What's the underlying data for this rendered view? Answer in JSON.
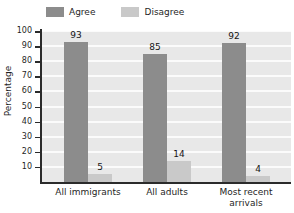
{
  "chart_data": {
    "type": "bar",
    "title": "",
    "xlabel": "",
    "ylabel": "Percentage",
    "ylim": [
      0,
      100
    ],
    "ytick_step": 10,
    "grid": true,
    "legend_position": "top",
    "categories": [
      "All immigrants",
      "All adults",
      "Most recent arrivals"
    ],
    "series": [
      {
        "name": "Agree",
        "color": "#8c8c8c",
        "values": [
          93,
          85,
          92
        ]
      },
      {
        "name": "Disagree",
        "color": "#c9c9c9",
        "values": [
          5,
          14,
          4
        ]
      }
    ],
    "y_ticks": [
      100,
      90,
      80,
      70,
      60,
      50,
      40,
      30,
      20,
      10
    ],
    "data_labels": [
      "93",
      "5",
      "85",
      "14",
      "92",
      "4"
    ],
    "category_lines": [
      [
        "All immigrants"
      ],
      [
        "All adults"
      ],
      [
        "Most recent",
        "arrivals"
      ]
    ]
  },
  "legend": {
    "items": [
      {
        "label": "Agree",
        "color": "#8c8c8c"
      },
      {
        "label": "Disagree",
        "color": "#c9c9c9"
      }
    ]
  },
  "axes": {
    "y_title": "Percentage"
  },
  "colors": {
    "plot_background": "#e8e8e8",
    "gridline": "#fbfbfb",
    "axis": "#2b2b2b",
    "agree": "#8c8c8c",
    "disagree": "#c9c9c9"
  }
}
